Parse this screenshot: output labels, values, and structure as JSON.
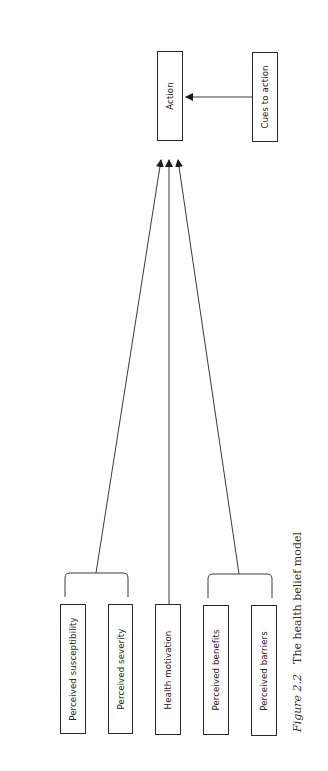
{
  "diagram": {
    "title": "The health belief model",
    "caption": {
      "figure_label": "Figure 2.2",
      "text": "The health belief model"
    },
    "nodes": {
      "action": {
        "label": "Action"
      },
      "cues": {
        "label": "Cues to action"
      },
      "susceptibility": {
        "label": "Perceived susceptibility"
      },
      "severity": {
        "label": "Perceived severity"
      },
      "motivation": {
        "label": "Health motivation"
      },
      "benefits": {
        "label": "Perceived benefits"
      },
      "barriers": {
        "label": "Perceived barriers"
      }
    },
    "edges": [
      {
        "from": "cues",
        "to": "action"
      },
      {
        "from": "susceptibility+severity",
        "to": "action"
      },
      {
        "from": "motivation",
        "to": "action"
      },
      {
        "from": "benefits+barriers",
        "to": "action"
      }
    ],
    "colors": {
      "line": "#3a3a3a",
      "box_border": "#2a2a2a",
      "text": "#222222"
    }
  }
}
